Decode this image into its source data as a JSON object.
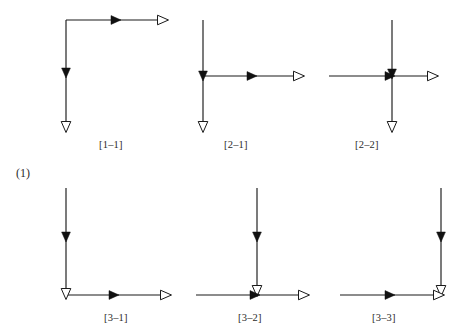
{
  "figure": {
    "group_label": "(1)",
    "background_color": "#ffffff",
    "line_color": "#1a1a1a",
    "solid_arrow_color": "#111111",
    "hollow_arrow_fill": "#ffffff",
    "width": 471,
    "height": 336
  },
  "diagrams": [
    {
      "id": "1-1",
      "caption": "[1–1]",
      "description": "elbow: vertical segment down from top-left corner with solid arrowhead midway and hollow arrowhead at bottom end; horizontal segment right from corner with solid arrowhead midway and hollow arrowhead at right end",
      "row": 1,
      "column": 1
    },
    {
      "id": "2-1",
      "caption": "[2–1]",
      "description": "tee: vertical line from top down through junction, solid arrowhead at junction, hollow arrowhead at bottom end; horizontal branch right from junction with solid arrowhead midway and hollow arrowhead at right end",
      "row": 1,
      "column": 2
    },
    {
      "id": "2-2",
      "caption": "[2–2]",
      "description": "cross: vertical line from top down through center with solid arrowhead at center and hollow arrowhead at bottom; horizontal line from left through center with solid arrowhead at center and hollow arrowhead at right",
      "row": 1,
      "column": 3
    },
    {
      "id": "3-1",
      "caption": "[3–1]",
      "description": "elbow: vertical segment down with solid arrowhead midway and hollow arrowhead at the bottom corner; horizontal segment right from corner with solid arrowhead midway and hollow arrowhead at right end",
      "row": 2,
      "column": 1
    },
    {
      "id": "3-2",
      "caption": "[3–2]",
      "description": "tee: vertical line down with solid arrowhead midway and hollow arrowhead at the junction; horizontal line through junction with solid arrowhead at junction and hollow arrowhead at right end",
      "row": 2,
      "column": 2
    },
    {
      "id": "3-3",
      "caption": "[3–3]",
      "description": "elbow at right: vertical line down on the right with solid arrowhead midway and hollow arrowhead at the bottom corner; horizontal line from left into the corner with solid arrowhead midway and hollow arrowhead at the corner",
      "row": 2,
      "column": 3
    }
  ]
}
